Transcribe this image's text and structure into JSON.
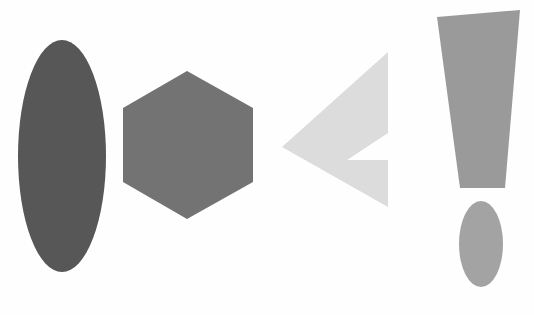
{
  "canvas": {
    "width": 534,
    "height": 315,
    "background_color": "#fefefe",
    "title": "Abstract Grayscale Geometric Shapes"
  },
  "palette": {
    "dark_gray": "#575757",
    "medium_gray": "#737373",
    "light_gray": "#a8a8a8",
    "very_light_gray": "#dddddd",
    "background": "#fefefe"
  },
  "shapes": [
    {
      "id": "ellipse-tall-dark",
      "name": "tall-dark-ellipse",
      "type": "ellipse",
      "fill": "#575757",
      "center_x": 62,
      "center_y": 156,
      "radius_x": 44,
      "radius_y": 116,
      "rotation": 0,
      "label": "Tall dark gray vertical ellipse"
    },
    {
      "id": "hexagon-medium",
      "name": "medium-gray-hexagon",
      "type": "polygon",
      "fill": "#737373",
      "points": "187,71 253,108 253,182 187,219 123,182 123,108",
      "label": "Medium gray regular hexagon"
    },
    {
      "id": "chevron-left-light",
      "name": "light-gray-left-chevron",
      "type": "polygon",
      "fill": "#dcdcdc",
      "points": "388,52 388,155 350,155 388,207 388,207 280,148 280,146",
      "points_actual": "388,52 282,147 388,207 388,160 347,160 388,133",
      "label": "Very light gray left-pointing chevron arrow"
    },
    {
      "id": "exclamation-bar",
      "name": "exclamation-mark-bar",
      "type": "polygon",
      "fill": "#9a9a9a",
      "points": "437,17 520,10 505,188 460,188",
      "label": "Gray tapered trapezoid, exclamation mark stem"
    },
    {
      "id": "exclamation-dot",
      "name": "exclamation-mark-dot",
      "type": "ellipse",
      "fill": "#a3a3a3",
      "center_x": 481,
      "center_y": 244,
      "radius_x": 22,
      "radius_y": 43,
      "rotation": 0,
      "label": "Gray small vertical ellipse, exclamation mark dot"
    }
  ],
  "shape_count": 5
}
